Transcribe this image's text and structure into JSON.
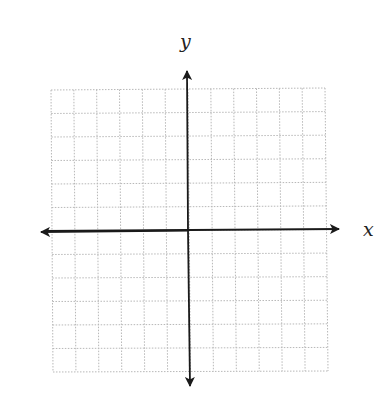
{
  "diagram": {
    "type": "coordinate-plane",
    "x_label": "x",
    "y_label": "y",
    "grid": {
      "columns": 12,
      "rows": 12,
      "style": "dotted",
      "color": "#b8b8b8"
    },
    "axis_color": "#1a1a1a"
  }
}
